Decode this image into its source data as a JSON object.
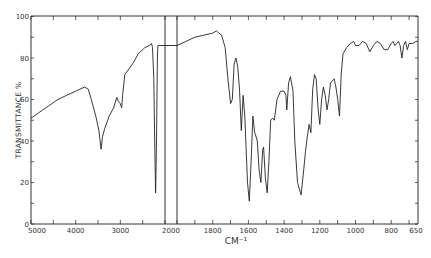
{
  "chart_data": {
    "type": "line",
    "title": "",
    "xlabel": "CM⁻¹",
    "ylabel": "TRANSMITTANCE %",
    "ylim": [
      0,
      100
    ],
    "xlim": [
      5000,
      650
    ],
    "grid": false,
    "legend": null,
    "x_scale_note": "Scale change at 2000 cm-1 (expanded scale below 2000)",
    "yticks": [
      0,
      20,
      40,
      60,
      80,
      100
    ],
    "ytick_minor": [
      10,
      30,
      50,
      70,
      90
    ],
    "xtick_labels": [
      "5000",
      "4000",
      "3000",
      "2000",
      "1800",
      "1600",
      "1400",
      "1200",
      "1000",
      "800",
      "650"
    ],
    "xtick_values": [
      5000,
      4000,
      3000,
      2000,
      1800,
      1600,
      1400,
      1200,
      1000,
      800,
      650
    ],
    "series": [
      {
        "name": "IR spectrum",
        "points": [
          [
            5000,
            51
          ],
          [
            4800,
            54
          ],
          [
            4600,
            57
          ],
          [
            4400,
            60
          ],
          [
            4200,
            62
          ],
          [
            4000,
            64
          ],
          [
            3800,
            66
          ],
          [
            3720,
            65
          ],
          [
            3650,
            60
          ],
          [
            3550,
            52
          ],
          [
            3480,
            45
          ],
          [
            3430,
            36
          ],
          [
            3400,
            42
          ],
          [
            3350,
            46
          ],
          [
            3250,
            52
          ],
          [
            3150,
            56
          ],
          [
            3080,
            61
          ],
          [
            3040,
            59
          ],
          [
            3000,
            58
          ],
          [
            2970,
            56
          ],
          [
            2950,
            62
          ],
          [
            2900,
            72
          ],
          [
            2800,
            75
          ],
          [
            2700,
            78
          ],
          [
            2600,
            82
          ],
          [
            2450,
            85
          ],
          [
            2350,
            86
          ],
          [
            2300,
            87
          ],
          [
            2280,
            85
          ],
          [
            2250,
            70
          ],
          [
            2230,
            40
          ],
          [
            2210,
            15
          ],
          [
            2190,
            40
          ],
          [
            2170,
            80
          ],
          [
            2160,
            86
          ],
          [
            2130,
            86
          ],
          [
            2000,
            86
          ],
          [
            2000,
            86
          ],
          [
            1950,
            88
          ],
          [
            1900,
            90
          ],
          [
            1850,
            91
          ],
          [
            1800,
            92
          ],
          [
            1780,
            93
          ],
          [
            1750,
            91
          ],
          [
            1730,
            85
          ],
          [
            1715,
            70
          ],
          [
            1700,
            58
          ],
          [
            1690,
            60
          ],
          [
            1680,
            77
          ],
          [
            1670,
            80
          ],
          [
            1660,
            76
          ],
          [
            1650,
            65
          ],
          [
            1640,
            45
          ],
          [
            1630,
            62
          ],
          [
            1620,
            52
          ],
          [
            1605,
            20
          ],
          [
            1595,
            11
          ],
          [
            1585,
            30
          ],
          [
            1575,
            52
          ],
          [
            1565,
            44
          ],
          [
            1560,
            43
          ],
          [
            1550,
            40
          ],
          [
            1540,
            26
          ],
          [
            1530,
            20
          ],
          [
            1520,
            36
          ],
          [
            1515,
            37
          ],
          [
            1505,
            22
          ],
          [
            1495,
            15
          ],
          [
            1485,
            30
          ],
          [
            1475,
            50
          ],
          [
            1465,
            51
          ],
          [
            1455,
            50
          ],
          [
            1440,
            60
          ],
          [
            1420,
            64
          ],
          [
            1400,
            64
          ],
          [
            1390,
            62
          ],
          [
            1385,
            55
          ],
          [
            1375,
            68
          ],
          [
            1365,
            71
          ],
          [
            1350,
            64
          ],
          [
            1340,
            40
          ],
          [
            1325,
            20
          ],
          [
            1305,
            14
          ],
          [
            1290,
            26
          ],
          [
            1280,
            35
          ],
          [
            1270,
            42
          ],
          [
            1260,
            48
          ],
          [
            1250,
            44
          ],
          [
            1240,
            65
          ],
          [
            1230,
            72
          ],
          [
            1220,
            70
          ],
          [
            1210,
            56
          ],
          [
            1200,
            48
          ],
          [
            1190,
            60
          ],
          [
            1180,
            66
          ],
          [
            1170,
            62
          ],
          [
            1160,
            55
          ],
          [
            1150,
            60
          ],
          [
            1140,
            68
          ],
          [
            1120,
            70
          ],
          [
            1110,
            66
          ],
          [
            1100,
            60
          ],
          [
            1090,
            52
          ],
          [
            1080,
            72
          ],
          [
            1070,
            82
          ],
          [
            1050,
            85
          ],
          [
            1030,
            87
          ],
          [
            1010,
            88
          ],
          [
            1000,
            86
          ],
          [
            980,
            86
          ],
          [
            960,
            88
          ],
          [
            940,
            87
          ],
          [
            920,
            83
          ],
          [
            900,
            86
          ],
          [
            880,
            88
          ],
          [
            860,
            87
          ],
          [
            840,
            84
          ],
          [
            820,
            84
          ],
          [
            800,
            87
          ],
          [
            790,
            88
          ],
          [
            780,
            86
          ],
          [
            770,
            87
          ],
          [
            760,
            88
          ],
          [
            750,
            86
          ],
          [
            740,
            80
          ],
          [
            730,
            86
          ],
          [
            720,
            88
          ],
          [
            710,
            84
          ],
          [
            700,
            87
          ],
          [
            680,
            87
          ],
          [
            660,
            88
          ],
          [
            650,
            88
          ]
        ]
      }
    ],
    "annotations": [
      "Scale-change box between 2000 (survey scale) and 2000 (expanded scale) at ~86%"
    ]
  }
}
